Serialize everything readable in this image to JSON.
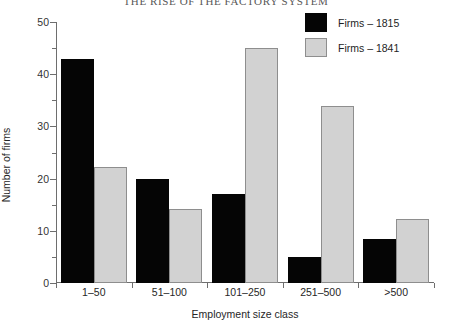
{
  "chart_data": {
    "type": "bar",
    "title": "THE RISE OF THE FACTORY SYSTEM",
    "xlabel": "Employment size class",
    "ylabel": "Number of firms",
    "categories": [
      "1–50",
      "51–100",
      "101–250",
      "251–500",
      ">500"
    ],
    "series": [
      {
        "name": "Firms – 1815",
        "color": "#050505",
        "values": [
          43,
          20,
          17,
          5,
          8.5
        ]
      },
      {
        "name": "Firms – 1841",
        "color": "#d2d2d2",
        "values": [
          22.3,
          14.2,
          45,
          34,
          12.3
        ]
      }
    ],
    "ylim": [
      0,
      50
    ],
    "yticks": [
      0,
      10,
      20,
      30,
      40,
      50
    ],
    "yticks_minor": [
      5,
      15,
      25,
      35,
      45
    ],
    "ytick_labels": [
      "0",
      "10",
      "20",
      "30",
      "40",
      "50"
    ],
    "grid": false,
    "legend_position": "top-right"
  },
  "legend": {
    "entries": [
      {
        "label": "Firms – 1815"
      },
      {
        "label": "Firms – 1841"
      }
    ]
  }
}
